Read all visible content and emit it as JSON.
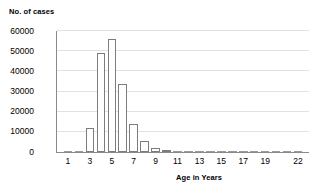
{
  "chart_data": {
    "type": "bar",
    "title": "",
    "xlabel": "Age in Years",
    "ylabel": "No. of cases",
    "ylim": [
      0,
      60000
    ],
    "ytick_values": [
      0,
      10000,
      20000,
      30000,
      40000,
      50000,
      60000
    ],
    "ytick_labels": [
      "0",
      "10000",
      "20000",
      "30000",
      "40000",
      "50000",
      "60000"
    ],
    "xlim": [
      0,
      23
    ],
    "xtick_labels": [
      "1",
      "3",
      "5",
      "7",
      "9",
      "11",
      "13",
      "15",
      "17",
      "19",
      "22"
    ],
    "xtick_positions": [
      1,
      3,
      5,
      7,
      9,
      11,
      13,
      15,
      17,
      19,
      22
    ],
    "grid": true,
    "legend": "none",
    "categories": [
      1,
      2,
      3,
      4,
      5,
      6,
      7,
      8,
      9,
      10,
      11,
      12,
      13,
      14,
      15,
      16,
      17,
      18,
      19,
      20,
      21,
      22
    ],
    "values": [
      200,
      700,
      11800,
      49000,
      56000,
      33500,
      14000,
      5500,
      2200,
      900,
      500,
      350,
      250,
      200,
      150,
      120,
      100,
      90,
      80,
      70,
      60,
      50
    ],
    "bar_color": "#ffffff",
    "bar_edge_color": "#7d7d7d",
    "grid_color": "#e2e2e2",
    "axis_color": "#8a8a8a"
  }
}
